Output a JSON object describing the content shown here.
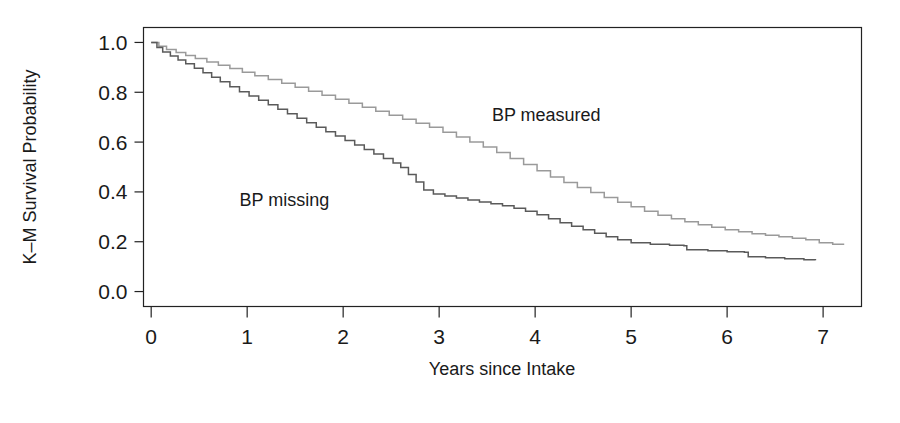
{
  "chart_data": {
    "type": "line",
    "subtype": "kaplan-meier-step",
    "title": "",
    "xlabel": "Years since Intake",
    "ylabel": "K–M Survival Probability",
    "xlim": [
      -0.08,
      7.4
    ],
    "ylim": [
      -0.06,
      1.06
    ],
    "xticks": [
      0,
      1,
      2,
      3,
      4,
      5,
      6,
      7
    ],
    "xtick_labels": [
      "0",
      "1",
      "2",
      "3",
      "4",
      "5",
      "6",
      "7"
    ],
    "yticks": [
      0.0,
      0.2,
      0.4,
      0.6,
      0.8,
      1.0
    ],
    "ytick_labels": [
      "0.0",
      "0.2",
      "0.4",
      "0.6",
      "0.8",
      "1.0"
    ],
    "grid": false,
    "legend": "inline-annotations",
    "frame": "box",
    "series": [
      {
        "name": "BP measured",
        "color": "#9a9a9a",
        "annotation_x": 3.55,
        "annotation_y": 0.685,
        "x": [
          0.0,
          0.08,
          0.16,
          0.26,
          0.36,
          0.46,
          0.58,
          0.7,
          0.82,
          0.95,
          1.08,
          1.22,
          1.36,
          1.5,
          1.64,
          1.78,
          1.92,
          2.06,
          2.2,
          2.34,
          2.48,
          2.62,
          2.76,
          2.9,
          3.04,
          3.18,
          3.32,
          3.46,
          3.6,
          3.74,
          3.88,
          4.02,
          4.16,
          4.3,
          4.44,
          4.58,
          4.72,
          4.86,
          5.0,
          5.14,
          5.28,
          5.42,
          5.56,
          5.7,
          5.84,
          5.98,
          6.12,
          6.26,
          6.4,
          6.54,
          6.68,
          6.82,
          6.96,
          7.1,
          7.22
        ],
        "y": [
          1.0,
          0.985,
          0.972,
          0.96,
          0.948,
          0.936,
          0.922,
          0.908,
          0.895,
          0.88,
          0.866,
          0.851,
          0.836,
          0.82,
          0.804,
          0.788,
          0.772,
          0.756,
          0.74,
          0.724,
          0.708,
          0.692,
          0.676,
          0.66,
          0.64,
          0.62,
          0.6,
          0.58,
          0.558,
          0.534,
          0.51,
          0.485,
          0.46,
          0.438,
          0.418,
          0.398,
          0.378,
          0.358,
          0.34,
          0.322,
          0.306,
          0.292,
          0.28,
          0.268,
          0.258,
          0.248,
          0.24,
          0.232,
          0.226,
          0.22,
          0.214,
          0.208,
          0.196,
          0.19,
          0.19
        ]
      },
      {
        "name": "BP missing",
        "color": "#5a5a5a",
        "annotation_x": 0.92,
        "annotation_y": 0.345,
        "x": [
          0.0,
          0.06,
          0.12,
          0.2,
          0.28,
          0.36,
          0.45,
          0.54,
          0.63,
          0.72,
          0.82,
          0.92,
          1.02,
          1.12,
          1.22,
          1.32,
          1.42,
          1.52,
          1.62,
          1.72,
          1.82,
          1.92,
          2.02,
          2.12,
          2.22,
          2.32,
          2.42,
          2.52,
          2.6,
          2.68,
          2.76,
          2.84,
          2.94,
          3.06,
          3.18,
          3.3,
          3.42,
          3.54,
          3.66,
          3.78,
          3.9,
          4.02,
          4.14,
          4.26,
          4.38,
          4.5,
          4.62,
          4.74,
          4.86,
          5.0,
          5.2,
          5.4,
          5.55,
          5.58,
          5.8,
          6.0,
          6.18,
          6.22,
          6.4,
          6.6,
          6.8,
          6.92
        ],
        "y": [
          1.0,
          0.98,
          0.962,
          0.946,
          0.93,
          0.914,
          0.896,
          0.878,
          0.86,
          0.842,
          0.822,
          0.802,
          0.785,
          0.768,
          0.75,
          0.732,
          0.714,
          0.696,
          0.678,
          0.66,
          0.642,
          0.624,
          0.606,
          0.588,
          0.57,
          0.552,
          0.534,
          0.516,
          0.498,
          0.47,
          0.44,
          0.408,
          0.392,
          0.384,
          0.376,
          0.368,
          0.36,
          0.352,
          0.344,
          0.334,
          0.322,
          0.308,
          0.292,
          0.276,
          0.262,
          0.248,
          0.234,
          0.22,
          0.208,
          0.196,
          0.19,
          0.186,
          0.184,
          0.168,
          0.164,
          0.16,
          0.158,
          0.14,
          0.136,
          0.132,
          0.128,
          0.126
        ]
      }
    ]
  },
  "axes": {
    "xlabel": "Years since Intake",
    "ylabel": "K–M Survival Probability"
  },
  "annotations": {
    "measured": "BP measured",
    "missing": "BP missing"
  },
  "colors": {
    "measured_line": "#9a9a9a",
    "missing_line": "#5a5a5a",
    "frame": "#222222",
    "text": "#1a1a1a",
    "background": "#ffffff"
  }
}
